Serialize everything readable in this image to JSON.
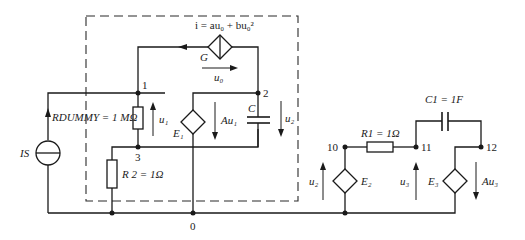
{
  "diagram": {
    "type": "circuit-schematic",
    "nodes": [
      {
        "id": "node-1",
        "label": "1"
      },
      {
        "id": "node-2",
        "label": "2"
      },
      {
        "id": "node-3",
        "label": "3"
      },
      {
        "id": "node-0",
        "label": "0"
      },
      {
        "id": "node-10",
        "label": "10"
      },
      {
        "id": "node-11",
        "label": "11"
      },
      {
        "id": "node-12",
        "label": "12"
      }
    ],
    "labels": {
      "g_equation": "i = au₀ + bu₀²",
      "g_name": "G",
      "u0": "u₀",
      "node1": "1",
      "node2": "2",
      "node3": "3",
      "node0": "0",
      "node10": "10",
      "node11": "11",
      "node12": "12",
      "rdummy": "RDUMMY = 1 MΩ",
      "u1": "u₁",
      "e1": "E₁",
      "au1": "Au₁",
      "c": "C",
      "u2_left": "u₂",
      "is": "IS",
      "r2": "R 2 = 1Ω",
      "r1": "R1 = 1Ω",
      "c1": "C1 = 1F",
      "u2_right": "u₂",
      "e2": "E₂",
      "u3": "u₃",
      "e3": "E₃",
      "au3": "Au₃"
    },
    "components": [
      {
        "name": "G",
        "kind": "voltage-controlled current source",
        "expr": "i = au0 + bu0^2"
      },
      {
        "name": "RDUMMY",
        "kind": "resistor",
        "value": "1 MΩ"
      },
      {
        "name": "R2",
        "kind": "resistor",
        "value": "1 Ω"
      },
      {
        "name": "E1",
        "kind": "voltage-controlled voltage source",
        "expr": "Au1"
      },
      {
        "name": "C",
        "kind": "capacitor"
      },
      {
        "name": "IS",
        "kind": "current source"
      },
      {
        "name": "R1",
        "kind": "resistor",
        "value": "1 Ω"
      },
      {
        "name": "C1",
        "kind": "capacitor",
        "value": "1 F"
      },
      {
        "name": "E2",
        "kind": "voltage-controlled voltage source",
        "expr": "u2"
      },
      {
        "name": "E3",
        "kind": "voltage-controlled voltage source",
        "expr": "Au3"
      }
    ]
  }
}
